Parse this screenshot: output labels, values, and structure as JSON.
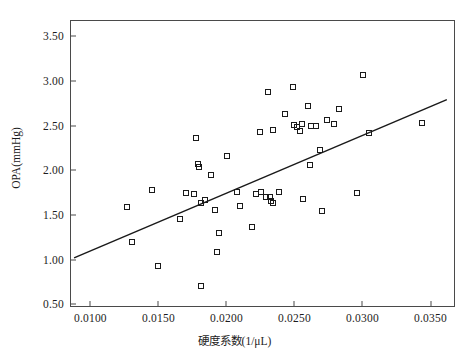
{
  "chart_data": {
    "type": "scatter",
    "title": "",
    "xlabel": "硬度系数(1/μL)",
    "ylabel": "OPA(mmHg)",
    "xlim": [
      0.0085,
      0.0368
    ],
    "ylim": [
      0.47,
      3.68
    ],
    "xticks": [
      0.01,
      0.015,
      0.02,
      0.025,
      0.03,
      0.035
    ],
    "xticklabels": [
      "0.0100",
      "0.0150",
      "0.0200",
      "0.0250",
      "0.0300",
      "0.0350"
    ],
    "yticks": [
      0.5,
      1.0,
      1.5,
      2.0,
      2.5,
      3.0,
      3.5
    ],
    "yticklabels": [
      "0.50",
      "1.00",
      "1.50",
      "2.00",
      "2.50",
      "3.00",
      "3.50"
    ],
    "grid": false,
    "legend": null,
    "marker": "open-square",
    "marker_color": "#1a1a1a",
    "line_color": "#1a1a1a",
    "frame_color": "#4a4a4a",
    "fit_line": {
      "type": "linear-regression",
      "x_start": 0.0088,
      "y_start": 1.02,
      "x_end": 0.0362,
      "y_end": 2.79
    },
    "points": [
      {
        "x": 0.0127,
        "y": 1.585
      },
      {
        "x": 0.01305,
        "y": 1.195
      },
      {
        "x": 0.01455,
        "y": 1.775
      },
      {
        "x": 0.015,
        "y": 0.93
      },
      {
        "x": 0.01655,
        "y": 1.455
      },
      {
        "x": 0.017,
        "y": 1.745
      },
      {
        "x": 0.0176,
        "y": 1.735
      },
      {
        "x": 0.01775,
        "y": 2.355
      },
      {
        "x": 0.0179,
        "y": 2.075
      },
      {
        "x": 0.018,
        "y": 2.04
      },
      {
        "x": 0.0181,
        "y": 1.63
      },
      {
        "x": 0.01815,
        "y": 0.705
      },
      {
        "x": 0.01845,
        "y": 1.665
      },
      {
        "x": 0.01885,
        "y": 1.95
      },
      {
        "x": 0.01915,
        "y": 1.555
      },
      {
        "x": 0.0193,
        "y": 1.085
      },
      {
        "x": 0.01945,
        "y": 1.3
      },
      {
        "x": 0.02005,
        "y": 2.155
      },
      {
        "x": 0.02075,
        "y": 1.76
      },
      {
        "x": 0.021,
        "y": 1.605
      },
      {
        "x": 0.0219,
        "y": 1.37
      },
      {
        "x": 0.02215,
        "y": 1.735
      },
      {
        "x": 0.0225,
        "y": 2.43
      },
      {
        "x": 0.02255,
        "y": 1.76
      },
      {
        "x": 0.0229,
        "y": 1.705
      },
      {
        "x": 0.02305,
        "y": 2.87
      },
      {
        "x": 0.0232,
        "y": 1.695
      },
      {
        "x": 0.02325,
        "y": 1.66
      },
      {
        "x": 0.0234,
        "y": 2.445
      },
      {
        "x": 0.02345,
        "y": 1.635
      },
      {
        "x": 0.02385,
        "y": 1.76
      },
      {
        "x": 0.0243,
        "y": 2.63
      },
      {
        "x": 0.0249,
        "y": 2.93
      },
      {
        "x": 0.025,
        "y": 2.51
      },
      {
        "x": 0.0252,
        "y": 2.485
      },
      {
        "x": 0.0254,
        "y": 2.44
      },
      {
        "x": 0.02555,
        "y": 2.52
      },
      {
        "x": 0.02565,
        "y": 1.68
      },
      {
        "x": 0.026,
        "y": 2.72
      },
      {
        "x": 0.02615,
        "y": 2.06
      },
      {
        "x": 0.02625,
        "y": 2.49
      },
      {
        "x": 0.0266,
        "y": 2.49
      },
      {
        "x": 0.0269,
        "y": 2.23
      },
      {
        "x": 0.027,
        "y": 1.545
      },
      {
        "x": 0.0274,
        "y": 2.56
      },
      {
        "x": 0.0279,
        "y": 2.515
      },
      {
        "x": 0.02825,
        "y": 2.685
      },
      {
        "x": 0.0296,
        "y": 1.745
      },
      {
        "x": 0.03005,
        "y": 3.065
      },
      {
        "x": 0.0305,
        "y": 2.42
      },
      {
        "x": 0.0344,
        "y": 2.525
      }
    ]
  },
  "figure": {
    "caption": ""
  }
}
